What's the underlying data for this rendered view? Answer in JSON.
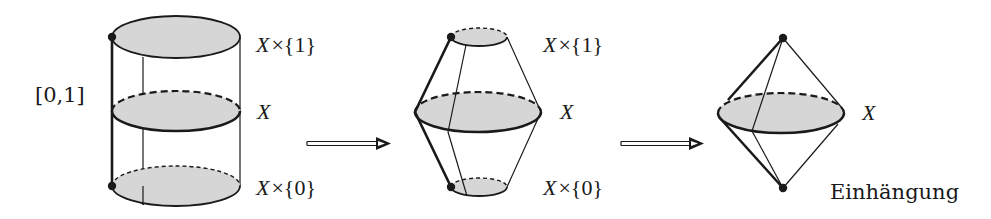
{
  "diagram": {
    "colors": {
      "stroke": "#1a1a1a",
      "fill": "#d6d6d6",
      "background": "#ffffff"
    },
    "panels": [
      {
        "id": "cylinder",
        "labels": {
          "top": "X×{1}",
          "top_var": "X",
          "top_rest": "×{1}",
          "middle": "X",
          "bottom": "X×{0}",
          "bottom_var": "X",
          "bottom_rest": "×{0}",
          "interval": "[0,1]"
        }
      },
      {
        "id": "pinched-cylinder",
        "labels": {
          "top": "X×{1}",
          "top_var": "X",
          "top_rest": "×{1}",
          "middle": "X",
          "bottom": "X×{0}",
          "bottom_var": "X",
          "bottom_rest": "×{0}"
        }
      },
      {
        "id": "suspension",
        "labels": {
          "middle": "X",
          "caption": "Einhängung"
        }
      }
    ],
    "arrows": [
      {
        "from": "cylinder",
        "to": "pinched-cylinder",
        "style": "double-line-open-head"
      },
      {
        "from": "pinched-cylinder",
        "to": "suspension",
        "style": "double-line-open-head"
      }
    ]
  }
}
